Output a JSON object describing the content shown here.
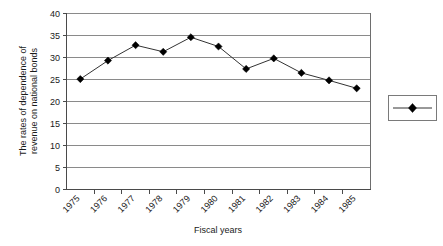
{
  "chart_data": {
    "type": "line",
    "title": "",
    "xlabel": "Fiscal years",
    "ylabel": "The rates of dependence of revenue on national bonds",
    "ylabel_line1": "The rates of dependence of",
    "ylabel_line2": "revenue on national bonds",
    "categories": [
      "1975",
      "1976",
      "1977",
      "1978",
      "1979",
      "1980",
      "1981",
      "1982",
      "1983",
      "1984",
      "1985"
    ],
    "values": [
      25.1,
      29.3,
      32.8,
      31.3,
      34.6,
      32.5,
      27.4,
      29.8,
      26.5,
      24.8,
      23.0
    ],
    "series": [
      {
        "name": "",
        "values": [
          25.1,
          29.3,
          32.8,
          31.3,
          34.6,
          32.5,
          27.4,
          29.8,
          26.5,
          24.8,
          23.0
        ],
        "marker": "diamond",
        "color": "#000000"
      }
    ],
    "ylim": [
      0,
      40
    ],
    "yticks": [
      0,
      5,
      10,
      15,
      20,
      25,
      30,
      35,
      40
    ],
    "ytick_labels": [
      "0",
      "5",
      "10",
      "15",
      "20",
      "25",
      "30",
      "35",
      "40"
    ],
    "xtick_labels": [
      "1975",
      "1976",
      "1977",
      "1978",
      "1979",
      "1980",
      "1981",
      "1982",
      "1983",
      "1984",
      "1985"
    ],
    "xtick_rotation": 45,
    "grid": "horizontal",
    "legend": {
      "position": "right",
      "entries": [
        {
          "label": "",
          "marker": "diamond",
          "color": "#000000"
        }
      ]
    },
    "colors": {
      "series": "#333333",
      "marker": "#000000",
      "gridline": "#8a8a8a",
      "plot_border": "#6e6e6e",
      "background": "#ffffff",
      "text": "#1a1a1a"
    }
  },
  "icons": {
    "legend_marker": "diamond-marker-icon",
    "data_marker": "diamond-marker-icon"
  }
}
